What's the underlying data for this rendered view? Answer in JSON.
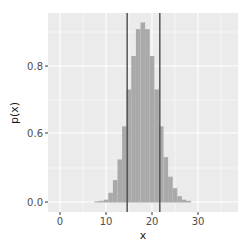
{
  "chart_data": {
    "type": "bar",
    "title": "",
    "xlabel": "x",
    "ylabel": "p(x)",
    "x_ticks": [
      0,
      10,
      20,
      30
    ],
    "y_ticks": [
      {
        "label": "0.0",
        "pixel": 202
      },
      {
        "label": "0.6",
        "pixel": 133
      },
      {
        "label": "0.8",
        "pixel": 66
      }
    ],
    "xlim": [
      -2.6,
      38.5
    ],
    "grid": true,
    "bar_width": 1,
    "x": [
      8,
      9,
      10,
      11,
      12,
      13,
      14,
      15,
      16,
      17,
      18,
      19,
      20,
      21,
      22,
      23,
      24,
      25,
      26,
      27,
      28
    ],
    "values": [
      0.005,
      0.01,
      0.02,
      0.08,
      0.19,
      0.37,
      0.62,
      0.73,
      0.83,
      0.91,
      0.93,
      0.91,
      0.83,
      0.73,
      0.62,
      0.39,
      0.22,
      0.12,
      0.05,
      0.02,
      0.01
    ],
    "vlines": [
      14.6,
      21.7
    ],
    "colors": {
      "panel": "#ebebeb",
      "grid": "#ffffff",
      "bar": "#a9a9a9",
      "vline": "#4a4a4a",
      "tick_text": "#4d4d4d",
      "title_text": "#1a1a1a"
    }
  }
}
